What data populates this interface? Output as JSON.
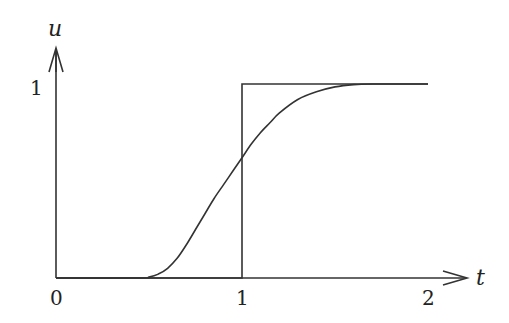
{
  "chart_data": {
    "type": "line",
    "title": "",
    "xlabel": "t",
    "ylabel": "u",
    "xlim": [
      0,
      2
    ],
    "ylim": [
      0,
      1
    ],
    "x_ticks": [
      "0",
      "1",
      "2"
    ],
    "y_ticks": [
      "1"
    ],
    "grid": false,
    "legend": "none",
    "series": [
      {
        "name": "step function",
        "points": [
          [
            0,
            0
          ],
          [
            1,
            0
          ],
          [
            1,
            1
          ],
          [
            2,
            1
          ]
        ]
      },
      {
        "name": "smooth approximation",
        "points": [
          [
            0,
            0
          ],
          [
            0.45,
            0
          ],
          [
            0.5,
            0.005
          ],
          [
            0.55,
            0.02
          ],
          [
            0.6,
            0.05
          ],
          [
            0.65,
            0.1
          ],
          [
            0.7,
            0.17
          ],
          [
            0.75,
            0.25
          ],
          [
            0.8,
            0.33
          ],
          [
            0.85,
            0.41
          ],
          [
            0.9,
            0.48
          ],
          [
            0.95,
            0.55
          ],
          [
            1.0,
            0.62
          ],
          [
            1.05,
            0.69
          ],
          [
            1.1,
            0.75
          ],
          [
            1.15,
            0.8
          ],
          [
            1.2,
            0.85
          ],
          [
            1.3,
            0.92
          ],
          [
            1.4,
            0.96
          ],
          [
            1.5,
            0.985
          ],
          [
            1.6,
            0.997
          ],
          [
            1.7,
            1.0
          ],
          [
            2.0,
            1.0
          ]
        ]
      }
    ]
  },
  "labels": {
    "x_axis": "t",
    "y_axis": "u",
    "x_tick_0": "0",
    "x_tick_1": "1",
    "x_tick_2": "2",
    "y_tick_1": "1"
  }
}
